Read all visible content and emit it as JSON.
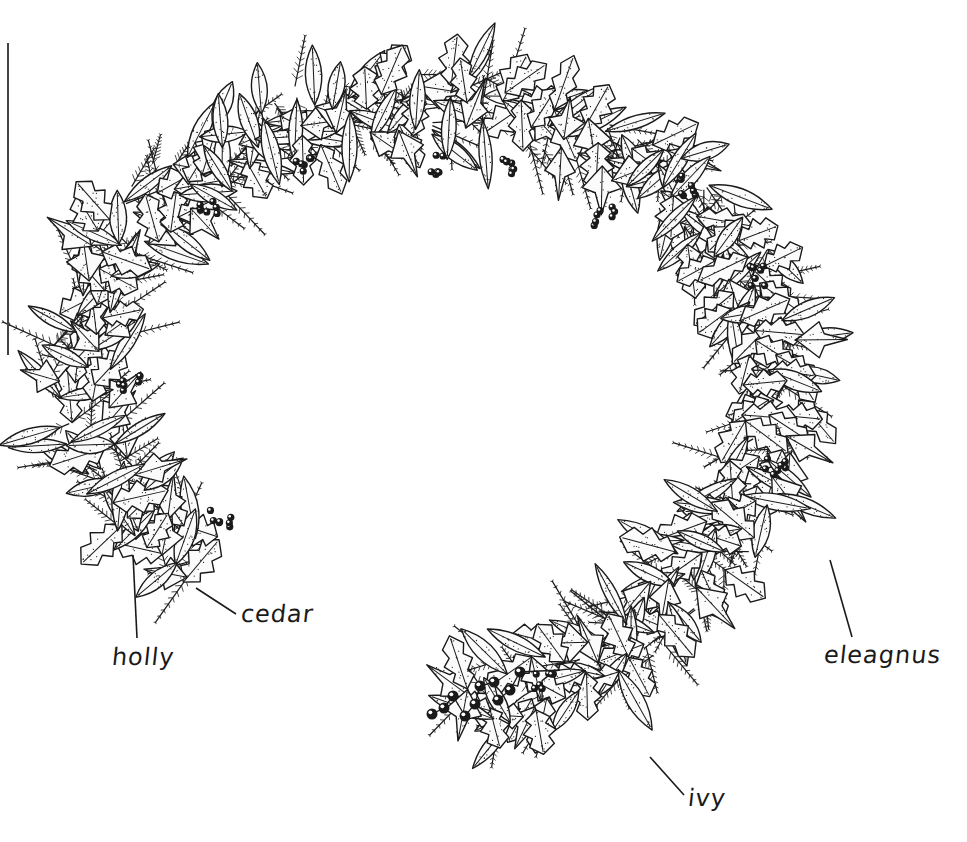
{
  "figure": {
    "ink_color": "#1a1a1a",
    "background_color": "#ffffff",
    "edge_rule": {
      "x": 7,
      "y_top": 43,
      "y_bottom": 355
    }
  },
  "labels": [
    {
      "id": "holly",
      "text": "holly",
      "x": 112,
      "y": 643,
      "leader": {
        "x1": 137,
        "y1": 638,
        "x2": 133,
        "y2": 555
      }
    },
    {
      "id": "cedar",
      "text": "cedar",
      "x": 241,
      "y": 600,
      "leader": {
        "x1": 236,
        "y1": 614,
        "x2": 196,
        "y2": 588
      }
    },
    {
      "id": "eleagnus",
      "text": "eleagnus",
      "x": 824,
      "y": 641,
      "leader": {
        "x1": 852,
        "y1": 637,
        "x2": 830,
        "y2": 560
      }
    },
    {
      "id": "ivy",
      "text": "ivy",
      "x": 688,
      "y": 784,
      "leader": {
        "x1": 684,
        "y1": 795,
        "x2": 650,
        "y2": 757
      }
    }
  ],
  "garland": {
    "materials": [
      "holly",
      "cedar",
      "eleagnus",
      "ivy",
      "berries"
    ],
    "path": [
      [
        200,
        560
      ],
      [
        120,
        500
      ],
      [
        80,
        400
      ],
      [
        90,
        300
      ],
      [
        140,
        220
      ],
      [
        210,
        160
      ],
      [
        300,
        120
      ],
      [
        400,
        105
      ],
      [
        500,
        110
      ],
      [
        600,
        140
      ],
      [
        680,
        190
      ],
      [
        740,
        260
      ],
      [
        770,
        340
      ],
      [
        770,
        430
      ],
      [
        740,
        510
      ],
      [
        690,
        580
      ],
      [
        620,
        640
      ],
      [
        540,
        680
      ],
      [
        460,
        710
      ]
    ],
    "berry_clusters": [
      {
        "x": 300,
        "y": 165
      },
      {
        "x": 440,
        "y": 165
      },
      {
        "x": 505,
        "y": 170
      },
      {
        "x": 605,
        "y": 215
      },
      {
        "x": 690,
        "y": 185
      },
      {
        "x": 755,
        "y": 275
      },
      {
        "x": 775,
        "y": 465
      },
      {
        "x": 210,
        "y": 205
      },
      {
        "x": 130,
        "y": 380
      },
      {
        "x": 220,
        "y": 520
      },
      {
        "x": 545,
        "y": 680
      }
    ],
    "berry_sprig": [
      [
        432,
        714
      ],
      [
        444,
        708
      ],
      [
        453,
        696
      ],
      [
        465,
        716
      ],
      [
        475,
        704
      ],
      [
        480,
        686
      ],
      [
        494,
        682
      ],
      [
        498,
        700
      ],
      [
        510,
        690
      ],
      [
        520,
        672
      ]
    ]
  }
}
